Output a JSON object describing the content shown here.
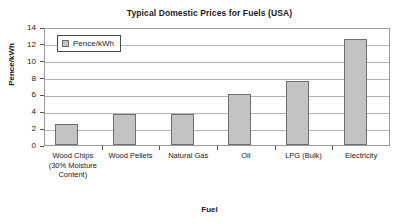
{
  "chart_data": {
    "type": "bar",
    "title": "Typical Domestic Prices for Fuels (USA)",
    "xlabel": "Fuel",
    "ylabel": "Pence/kWh",
    "categories": [
      "Wood Chips (30% Moisture Content)",
      "Wood Pellets",
      "Natural Gas",
      "Oil",
      "LPG (Bulk)",
      "Electricity"
    ],
    "values": [
      2.5,
      3.7,
      3.65,
      6.0,
      7.6,
      12.6
    ],
    "series": [
      {
        "name": "Pence/kWh",
        "values": [
          2.5,
          3.7,
          3.65,
          6.0,
          7.6,
          12.6
        ]
      }
    ],
    "ylim": [
      0,
      14
    ],
    "ytick_values": [
      0,
      2,
      4,
      6,
      8,
      10,
      12,
      14
    ],
    "ytick_labels": [
      "0",
      "2",
      "4",
      "6",
      "8",
      "10",
      "12",
      "14"
    ],
    "grid": "horizontal",
    "legend": {
      "position": "top-left-inside",
      "entries": [
        "Pence/kWh"
      ]
    },
    "bar_color": "#c3c3c3",
    "bar_border_color": "#6e6e6e",
    "grid_color": "#b4b4b4",
    "axis_color": "#555555"
  }
}
